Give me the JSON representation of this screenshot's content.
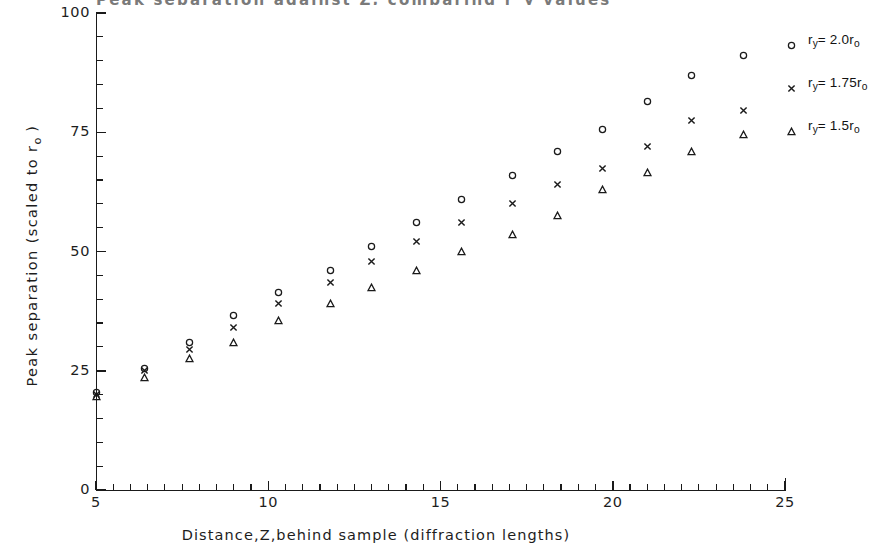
{
  "figure": {
    "cut_off_title": "Peak separation against Z, comparing r_y values",
    "plot_area": {
      "x_left": 96,
      "x_right": 785,
      "y_top": 13,
      "y_bottom": 490
    }
  },
  "axes": {
    "x": {
      "label": "Distance,Z,behind sample (diffraction lengths)",
      "min": 5,
      "max": 25,
      "major_ticks": [
        5,
        10,
        15,
        20,
        25
      ],
      "major_tick_labels": [
        "5",
        "10",
        "15",
        "20",
        "25"
      ],
      "minor_tick_step": 0.5
    },
    "y": {
      "label_text": "Peak separation (scaled to r",
      "label_sub": "o",
      "label_tail": " )",
      "label_full": "Peak separation (scaled to ro )",
      "min": 0,
      "max": 100,
      "major_ticks": [
        0,
        25,
        50,
        75,
        100
      ],
      "major_tick_labels": [
        "0",
        "25",
        "50",
        "75",
        "100"
      ],
      "minor_tick_step": 5
    }
  },
  "legend": {
    "position": "top-right",
    "entries": [
      {
        "marker": "open-circle",
        "prefix": "r",
        "sub1": "y",
        "mid": "= 2.0r",
        "sub2": "o",
        "full": "r y= 2.0r o"
      },
      {
        "marker": "cross",
        "prefix": "r",
        "sub1": "y",
        "mid": "= 1.75r",
        "sub2": "o",
        "full": "r y= 1.75r o"
      },
      {
        "marker": "open-triangle",
        "prefix": "r",
        "sub1": "y",
        "mid": "= 1.5r",
        "sub2": "o",
        "full": "r y= 1.5r o"
      }
    ]
  },
  "chart_data": {
    "type": "scatter",
    "title": "",
    "xlabel": "Distance,Z,behind sample (diffraction lengths)",
    "ylabel": "Peak separation (scaled to ro )",
    "xlim": [
      5,
      25
    ],
    "ylim": [
      0,
      100
    ],
    "grid": false,
    "legend_position": "top-right",
    "x": [
      5.0,
      6.4,
      7.7,
      9.0,
      10.3,
      11.8,
      13.0,
      14.3,
      15.6,
      17.1,
      18.4,
      19.7,
      21.0,
      22.3,
      23.8
    ],
    "series": [
      {
        "name": "r y= 2.0r o",
        "marker": "open-circle",
        "color": "#1a1a1a",
        "values": [
          20.5,
          25.5,
          31.0,
          36.5,
          41.5,
          46.0,
          51.0,
          56.0,
          61.0,
          66.0,
          71.0,
          75.5,
          81.5,
          87.0,
          91.0
        ]
      },
      {
        "name": "r y= 1.75r o",
        "marker": "cross",
        "color": "#1a1a1a",
        "values": [
          20.0,
          25.0,
          29.5,
          34.0,
          39.0,
          43.5,
          48.0,
          52.0,
          56.0,
          60.0,
          64.0,
          67.5,
          72.0,
          77.5,
          79.5
        ]
      },
      {
        "name": "r y= 1.5r o",
        "marker": "open-triangle",
        "color": "#1a1a1a",
        "values": [
          19.5,
          23.5,
          27.5,
          31.0,
          35.5,
          39.0,
          42.5,
          46.0,
          50.0,
          53.5,
          57.5,
          63.0,
          66.5,
          71.0,
          74.5
        ]
      }
    ]
  }
}
